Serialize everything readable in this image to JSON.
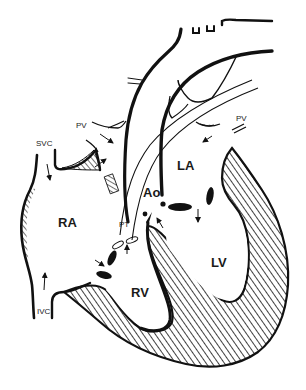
{
  "figure": {
    "background": "#ffffff",
    "ink_color": "#111111"
  },
  "labels": {
    "svc": "SVC",
    "pv_left": "PV",
    "pv_right": "PV",
    "la": "LA",
    "ao": "Ao",
    "ra": "RA",
    "pt": "PT",
    "lv": "LV",
    "rv": "RV",
    "ivc": "IVC"
  },
  "structures": [
    {
      "id": "svc",
      "name": "Superior vena cava"
    },
    {
      "id": "ivc",
      "name": "Inferior vena cava"
    },
    {
      "id": "ra",
      "name": "Right atrium"
    },
    {
      "id": "rv",
      "name": "Right ventricle"
    },
    {
      "id": "pt",
      "name": "Pulmonary trunk"
    },
    {
      "id": "pv",
      "name": "Pulmonary veins"
    },
    {
      "id": "la",
      "name": "Left atrium"
    },
    {
      "id": "lv",
      "name": "Left ventricle"
    },
    {
      "id": "ao",
      "name": "Aorta"
    }
  ],
  "flow_arrows": [
    {
      "id": "svc-down",
      "from": "SVC",
      "to": "RA"
    },
    {
      "id": "ivc-up",
      "from": "IVC",
      "to": "RA"
    },
    {
      "id": "pv-left-in",
      "from": "PV",
      "to": "LA"
    },
    {
      "id": "pv-right-in",
      "from": "PV",
      "to": "LA"
    },
    {
      "id": "la-to-lv",
      "from": "LA",
      "to": "LV"
    },
    {
      "id": "lv-to-ao",
      "from": "LV",
      "to": "Ao"
    },
    {
      "id": "ra-to-rv",
      "from": "RA",
      "to": "RV"
    },
    {
      "id": "rv-to-pt",
      "from": "RV",
      "to": "PT"
    }
  ]
}
